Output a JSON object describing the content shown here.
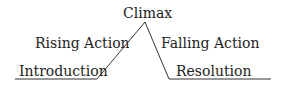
{
  "diagram": {
    "line_color": "#333333",
    "labels": {
      "climax": "Climax",
      "rising_action": "Rising Action",
      "falling_action": "Falling Action",
      "introduction": "Introduction",
      "resolution": "Resolution"
    }
  }
}
